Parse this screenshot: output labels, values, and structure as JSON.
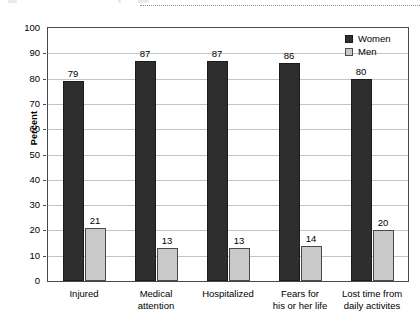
{
  "chart_data": {
    "type": "bar",
    "title": "",
    "xlabel": "",
    "ylabel": "Percent",
    "ylim": [
      0,
      100
    ],
    "ytick_step": 10,
    "yticks": [
      100,
      90,
      80,
      70,
      60,
      50,
      40,
      30,
      20,
      10,
      0
    ],
    "grid": true,
    "grid_axis": "y",
    "legend_position": "top-right",
    "categories": [
      "Injured",
      "Medical\nattention",
      "Hospitalized",
      "Fears for\nhis or her life",
      "Lost time from\ndaily activites"
    ],
    "series": [
      {
        "name": "Women",
        "color": "#2e2e2e",
        "values": [
          79,
          87,
          87,
          86,
          80
        ],
        "labels": [
          "79",
          "87",
          "87",
          "86",
          "80"
        ]
      },
      {
        "name": "Men",
        "color": "#c9c9c9",
        "values": [
          21,
          13,
          13,
          14,
          20
        ],
        "labels": [
          "21",
          "13",
          "13",
          "14",
          "20"
        ]
      }
    ]
  },
  "legend": {
    "items": [
      {
        "label": "Women",
        "swatch": "dark-square-icon"
      },
      {
        "label": "Men",
        "swatch": "light-square-icon"
      }
    ]
  },
  "axes": {
    "y_title": "Percent",
    "y_tick_labels": [
      "100",
      "90",
      "80",
      "70",
      "60",
      "50",
      "40",
      "30",
      "20",
      "10",
      "0"
    ]
  }
}
